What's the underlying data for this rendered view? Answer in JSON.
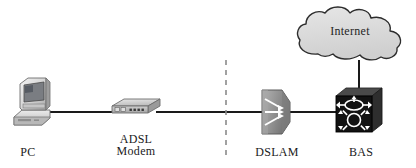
{
  "diagram": {
    "background_color": "#ffffff",
    "line_color": "#1a1a1a",
    "nodes": [
      {
        "id": "pc",
        "label": "PC",
        "icon": "desktop-computer-icon",
        "description": "CRT monitor on horizontal desktop case",
        "color": "#d8d8d8"
      },
      {
        "id": "adsl-modem",
        "label": "ADSL\nModem",
        "icon": "modem-icon",
        "description": "Flat box with front panel ports and indicator lights",
        "color": "#c9c9c9"
      },
      {
        "id": "dslam",
        "label": "DSLAM",
        "icon": "multiplexer-icon",
        "description": "Funnel shaped multiplexer with converging arrows",
        "color": "#9a9a9a"
      },
      {
        "id": "bas",
        "label": "BAS",
        "icon": "router-icon",
        "description": "Dark cube with two router symbols",
        "color": "#141414"
      },
      {
        "id": "internet",
        "label": "Internet",
        "icon": "cloud-icon",
        "description": "Network cloud",
        "color": "#dcdcdc"
      }
    ],
    "links": [
      {
        "id": "pc-to-modem",
        "from": "pc",
        "to": "adsl-modem",
        "style": "solid"
      },
      {
        "id": "modem-to-dslam",
        "from": "adsl-modem",
        "to": "dslam",
        "style": "solid"
      },
      {
        "id": "dslam-to-bas",
        "from": "dslam",
        "to": "bas",
        "style": "solid"
      },
      {
        "id": "bas-to-internet",
        "from": "bas",
        "to": "internet",
        "style": "solid"
      }
    ],
    "divider": {
      "id": "demarcation-divider",
      "style": "dashed",
      "orientation": "vertical"
    }
  }
}
